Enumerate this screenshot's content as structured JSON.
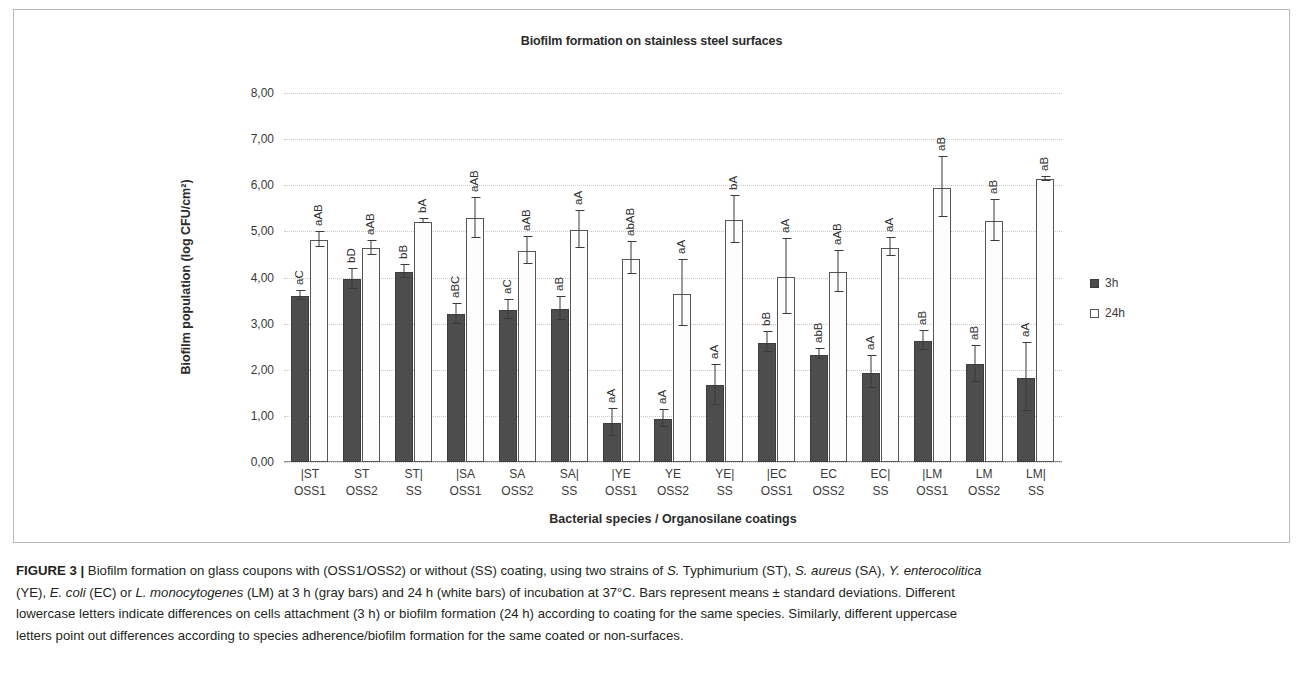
{
  "figure": {
    "label": "FIGURE 3",
    "separator": "|"
  },
  "chart": {
    "title": "Biofilm formation on stainless steel surfaces",
    "legend_position": "right"
  },
  "legend": {
    "items": [
      {
        "label": "3h",
        "swatch": "filled-dark-square"
      },
      {
        "label": "24h",
        "swatch": "open-white-square"
      }
    ]
  },
  "axes": {
    "y_title": "Biofilm population (log CFU/cm²)",
    "x_title": "Bacterial species / Organosilane coatings",
    "y_ticks": [
      "0,00",
      "1,00",
      "2,00",
      "3,00",
      "4,00",
      "5,00",
      "6,00",
      "7,00",
      "8,00"
    ]
  },
  "caption": {
    "line1_a": "Biofilm formation on glass coupons with (OSS1/OSS2) or without (SS) coating, using two strains of ",
    "line1_sp1": "S.",
    "line1_b": " Typhimurium (ST), ",
    "line1_sp2": "S. aureus",
    "line1_c": " (SA), ",
    "line1_sp3": "Y. enterocolitica",
    "line2_a": "(YE), ",
    "line2_sp1": "E. coli",
    "line2_b": " (EC) or ",
    "line2_sp2": "L. monocytogenes",
    "line2_c": " (LM) at 3 h (gray bars) and 24 h (white bars) of incubation at 37°C. Bars represent means ± standard deviations. Different",
    "line3": "lowercase letters indicate differences on cells attachment (3 h) or biofilm formation (24 h) according to coating for the same species. Similarly, different uppercase",
    "line4": "letters point out differences according to species adherence/biofilm formation for the same coated or non-surfaces."
  },
  "chart_data": {
    "type": "bar",
    "title": "Biofilm formation on stainless steel surfaces",
    "xlabel": "Bacterial species / Organosilane coatings",
    "ylabel": "Biofilm population (log CFU/cm²)",
    "ylim": [
      0,
      8
    ],
    "ytick_step": 1,
    "grid": true,
    "categories": [
      "|ST OSS1",
      "ST OSS2",
      "ST| SS",
      "|SA OSS1",
      "SA OSS2",
      "SA| SS",
      "|YE OSS1",
      "YE OSS2",
      "YE| SS",
      "|EC OSS1",
      "EC OSS2",
      "EC| SS",
      "|LM OSS1",
      "LM OSS2",
      "LM| SS"
    ],
    "category_lines": [
      {
        "l1": "|ST",
        "l2": "OSS1"
      },
      {
        "l1": "ST",
        "l2": "OSS2"
      },
      {
        "l1": "ST|",
        "l2": "SS"
      },
      {
        "l1": "|SA",
        "l2": "OSS1"
      },
      {
        "l1": "SA",
        "l2": "OSS2"
      },
      {
        "l1": "SA|",
        "l2": "SS"
      },
      {
        "l1": "|YE",
        "l2": "OSS1"
      },
      {
        "l1": "YE",
        "l2": "OSS2"
      },
      {
        "l1": "YE|",
        "l2": "SS"
      },
      {
        "l1": "|EC",
        "l2": "OSS1"
      },
      {
        "l1": "EC",
        "l2": "OSS2"
      },
      {
        "l1": "EC|",
        "l2": "SS"
      },
      {
        "l1": "|LM",
        "l2": "OSS1"
      },
      {
        "l1": "LM",
        "l2": "OSS2"
      },
      {
        "l1": "LM|",
        "l2": "SS"
      }
    ],
    "series": [
      {
        "name": "3h",
        "color": "#4d4d4d",
        "values": [
          3.6,
          3.96,
          4.12,
          3.2,
          3.29,
          3.31,
          0.84,
          0.93,
          1.66,
          2.59,
          2.33,
          1.94,
          2.63,
          2.12,
          1.83
        ],
        "errors": [
          0.1,
          0.22,
          0.15,
          0.22,
          0.22,
          0.26,
          0.3,
          0.2,
          0.45,
          0.22,
          0.12,
          0.36,
          0.22,
          0.4,
          0.74
        ],
        "letters": [
          "aC",
          "bD",
          "bB",
          "aBC",
          "aC",
          "aB",
          "aA",
          "aA",
          "aA",
          "bB",
          "abB",
          "aA",
          "aB",
          "aB",
          "aA"
        ]
      },
      {
        "name": "24h",
        "color": "#ffffff",
        "values": [
          4.82,
          4.63,
          5.21,
          5.28,
          4.58,
          5.03,
          4.41,
          3.65,
          5.25,
          4.01,
          4.12,
          4.65,
          5.95,
          5.22,
          6.13
        ],
        "errors": [
          0.17,
          0.17,
          0.05,
          0.44,
          0.3,
          0.42,
          0.35,
          0.72,
          0.52,
          0.83,
          0.45,
          0.21,
          0.67,
          0.45,
          0.06
        ],
        "letters": [
          "aAB",
          "aAB",
          "bA",
          "aAB",
          "aAB",
          "aA",
          "abAB",
          "aA",
          "bA",
          "aA",
          "aAB",
          "aA",
          "aB",
          "aB",
          "aB"
        ]
      }
    ]
  }
}
